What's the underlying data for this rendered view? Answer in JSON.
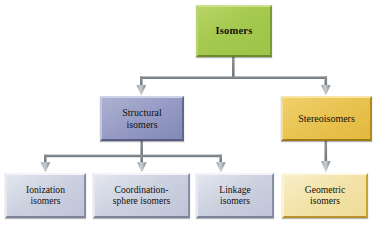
{
  "diagram": {
    "background_color": "#ffffff",
    "connector_color": "#7b8288",
    "nodes": {
      "root": {
        "label": "Isomers",
        "color": "#a6c94f",
        "level": 1
      },
      "structural": {
        "label": "Structural\nisomers",
        "line1": "Structural",
        "line2": "isomers",
        "color": "#959bc4",
        "level": 2
      },
      "stereo": {
        "label": "Stereoisomers",
        "line1": "Stereoisomers",
        "line2": "",
        "color": "#e9c352",
        "level": 2
      },
      "ionization": {
        "line1": "Ionization",
        "line2": "isomers",
        "color": "#ccd1e0",
        "level": 3
      },
      "coordination": {
        "line1": "Coordination-",
        "line2": "sphere isomers",
        "color": "#ccd1e0",
        "level": 3
      },
      "linkage": {
        "line1": "Linkage",
        "line2": "isomers",
        "color": "#ccd1e0",
        "level": 3
      },
      "geometric": {
        "line1": "Geometric",
        "line2": "isomers",
        "color": "#f3e3a9",
        "level": 3
      }
    },
    "edges": [
      {
        "from": "root",
        "to": "structural",
        "arrow": "down"
      },
      {
        "from": "root",
        "to": "stereo",
        "arrow": "down"
      },
      {
        "from": "structural",
        "to": "ionization",
        "arrow": "down"
      },
      {
        "from": "structural",
        "to": "coordination",
        "arrow": "down"
      },
      {
        "from": "structural",
        "to": "linkage",
        "arrow": "down"
      },
      {
        "from": "stereo",
        "to": "geometric",
        "arrow": "down"
      }
    ]
  }
}
